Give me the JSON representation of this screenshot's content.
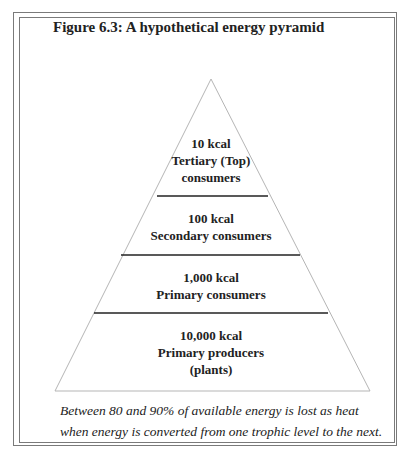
{
  "figure": {
    "title": "Figure 6.3: A hypothetical energy pyramid",
    "levels": [
      {
        "energy": "10 kcal",
        "name_line1": "Tertiary (Top)",
        "name_line2": "consumers"
      },
      {
        "energy": "100 kcal",
        "name_line1": "Secondary consumers"
      },
      {
        "energy": "1,000 kcal",
        "name_line1": "Primary consumers"
      },
      {
        "energy": "10,000 kcal",
        "name_line1": "Primary producers",
        "name_line2": "(plants)"
      }
    ],
    "caption_line1": "Between 80 and 90% of available energy is lost as heat",
    "caption_line2": "when energy is converted from one trophic level to the next."
  }
}
